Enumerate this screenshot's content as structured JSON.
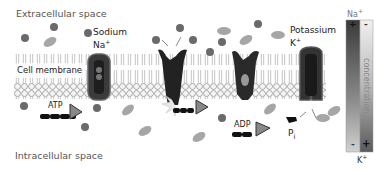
{
  "labels": {
    "extracellular": "Extracellular space",
    "intracellular": "Intracellular space",
    "membrane": "Cell membrane",
    "sodium": "Sodium",
    "sodium_symbol": "Na",
    "potassium": "Potassium",
    "potassium_symbol": "K",
    "atp": "ATP",
    "adp": "ADP",
    "pi": "P",
    "pi_sub": "i",
    "plus": "+",
    "concentration": "concentration"
  },
  "gradient_bar": {
    "top_label": "Na",
    "bottom_label": "K",
    "na_top_sign": "+",
    "k_top_sign": "-",
    "na_bottom_sign": "-",
    "k_bottom_sign": "+"
  },
  "colors": {
    "membrane_head": "#f2f2f2",
    "pump": "#2a2a2a",
    "pump_edge": "#555555",
    "sodium_ion": "#6e6e6e",
    "potassium_ion": "#a8a8a8",
    "arrow_head": "#8a8a8a"
  }
}
